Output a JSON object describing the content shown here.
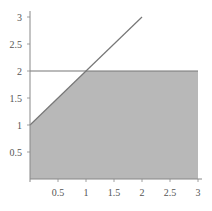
{
  "chart_data": {
    "type": "area",
    "title": "",
    "xlabel": "",
    "ylabel": "",
    "xlim": [
      0,
      3
    ],
    "ylim": [
      0,
      3
    ],
    "grid": false,
    "x_ticks": [
      "0.5",
      "1",
      "1.5",
      "2",
      "2.5",
      "3"
    ],
    "y_ticks": [
      "0.5",
      "1",
      "1.5",
      "2",
      "2.5",
      "3"
    ],
    "series": [
      {
        "name": "y = x + 1",
        "type": "line",
        "x": [
          0,
          2
        ],
        "y": [
          1,
          3
        ],
        "color": "#777777"
      },
      {
        "name": "y = 2",
        "type": "line",
        "x": [
          0,
          3
        ],
        "y": [
          2,
          2
        ],
        "color": "#777777"
      },
      {
        "name": "region y <= min(x + 1, 2)",
        "type": "area",
        "x": [
          0,
          1,
          3
        ],
        "y": [
          1,
          2,
          2
        ],
        "fill": "#b8b8b8"
      }
    ]
  },
  "colors": {
    "axis": "#888888",
    "line": "#777777",
    "fill": "#b8b8b8",
    "tick_text": "#555555"
  }
}
